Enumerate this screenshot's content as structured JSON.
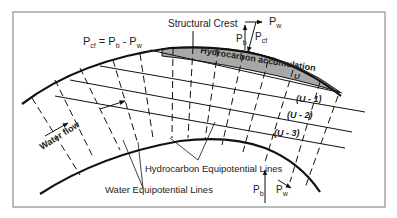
{
  "diagram": {
    "labels": {
      "structural_crest": "Structural Crest",
      "equation_main": "P",
      "equation_sub_cf": "cf",
      "equation_eq": " = P",
      "equation_sub_b": "b",
      "equation_minus": " - P",
      "equation_sub_w": "w",
      "vector_pw": "P",
      "vector_pw_sub": "w",
      "vector_pb": "P",
      "vector_pb_sub": "b",
      "vector_pcf": "P",
      "vector_pcf_sub": "cf",
      "hydrocarbon_accumulation": "Hydrocarbon accumulation",
      "u": "U",
      "u1": "(U - 1)",
      "u2": "(U - 2)",
      "u3": "(U - 3)",
      "water_flow": "Water flow",
      "hydrocarbon_equipotential": "Hydrocarbon Equipotential Lines",
      "water_equipotential": "Water Equipotential Lines",
      "bottom_pb": "P",
      "bottom_pb_sub": "b",
      "bottom_pw": "P",
      "bottom_pw_sub": "w"
    },
    "colors": {
      "line": "#111111",
      "accumulation_fill": "#a8a8a8",
      "frame": "#777777"
    }
  }
}
